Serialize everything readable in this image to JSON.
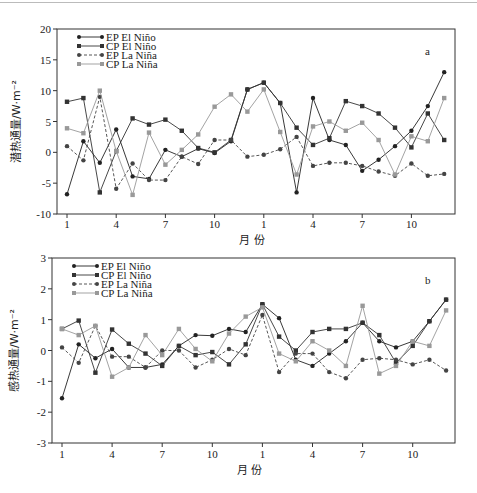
{
  "chart_data": [
    {
      "type": "line",
      "panel_label": "a",
      "xlabel": "月 份",
      "ylabel": "潜热通量/W·m⁻²",
      "ylim": [
        -10,
        20
      ],
      "yticks": [
        -10,
        -5,
        0,
        5,
        10,
        15,
        20
      ],
      "x_tick_labels": [
        "1",
        "4",
        "7",
        "10",
        "1",
        "4",
        "7",
        "10"
      ],
      "x_tick_index": [
        0,
        3,
        6,
        9,
        12,
        15,
        18,
        21
      ],
      "legend_position": "upper-left",
      "grid": false,
      "series": [
        {
          "name": "EP El Niño",
          "color": "#222222",
          "marker": "circle",
          "dash": "",
          "values": [
            -6.8,
            1.8,
            -1.7,
            3.7,
            -3.9,
            -4.3,
            0.4,
            -0.7,
            0.6,
            -0.1,
            1.8,
            10.2,
            11.3,
            8.0,
            -6.5,
            8.8,
            2.0,
            1.2,
            -3.0,
            -1.2,
            1.0,
            3.5,
            7.5,
            13.0
          ]
        },
        {
          "name": "CP El Niño",
          "color": "#333333",
          "marker": "square",
          "dash": "",
          "values": [
            8.2,
            8.8,
            -6.5,
            0.2,
            5.5,
            4.5,
            5.3,
            3.5,
            0.7,
            0.0,
            2.0,
            10.2,
            11.3,
            8.0,
            4.0,
            1.2,
            2.3,
            8.3,
            7.5,
            6.3,
            4.0,
            0.8,
            6.3,
            2.0
          ]
        },
        {
          "name": "EP La Niña",
          "color": "#444444",
          "marker": "circle",
          "dash": "3,2",
          "values": [
            1.0,
            -1.3,
            9.0,
            -5.9,
            -1.8,
            -4.5,
            -4.5,
            -0.7,
            -1.9,
            2.0,
            2.0,
            -0.7,
            -0.4,
            0.5,
            2.5,
            -2.2,
            -1.7,
            -1.7,
            -2.2,
            -3.1,
            -3.8,
            -1.8,
            -3.8,
            -3.5
          ]
        },
        {
          "name": "CP La Niña",
          "color": "#999999",
          "marker": "square",
          "dash": "",
          "values": [
            3.9,
            3.1,
            10.0,
            0.2,
            -6.9,
            3.2,
            -2.0,
            0.4,
            2.9,
            7.4,
            9.4,
            6.6,
            10.2,
            3.3,
            -3.6,
            4.2,
            5.0,
            3.5,
            4.8,
            2.0,
            -3.6,
            2.6,
            1.8,
            8.8
          ]
        }
      ]
    },
    {
      "type": "line",
      "panel_label": "b",
      "xlabel": "月 份",
      "ylabel": "感热通量/W·m⁻²",
      "ylim": [
        -3,
        3
      ],
      "yticks": [
        -3,
        -2,
        -1,
        0,
        1,
        2,
        3
      ],
      "x_tick_labels": [
        "1",
        "4",
        "7",
        "10",
        "1",
        "4",
        "7",
        "10"
      ],
      "x_tick_index": [
        0,
        3,
        6,
        9,
        12,
        15,
        18,
        21
      ],
      "legend_position": "upper-left",
      "grid": false,
      "series": [
        {
          "name": "EP El Niño",
          "color": "#222222",
          "marker": "circle",
          "dash": "",
          "values": [
            -1.55,
            0.2,
            -0.25,
            0.05,
            -0.55,
            -0.55,
            -0.45,
            0.15,
            0.5,
            0.48,
            0.7,
            0.6,
            1.5,
            1.05,
            -0.3,
            -0.5,
            -0.1,
            0.3,
            0.9,
            0.3,
            0.1,
            0.3,
            0.95,
            1.65
          ]
        },
        {
          "name": "CP El Niño",
          "color": "#333333",
          "marker": "square",
          "dash": "",
          "values": [
            0.7,
            0.97,
            -0.72,
            0.68,
            0.22,
            -0.1,
            -0.5,
            0.15,
            -0.15,
            -0.05,
            -0.45,
            0.2,
            1.5,
            0.45,
            0.0,
            0.6,
            0.7,
            0.7,
            0.9,
            0.5,
            -0.4,
            0.15,
            0.95,
            1.65
          ]
        },
        {
          "name": "EP La Niña",
          "color": "#444444",
          "marker": "circle",
          "dash": "3,2",
          "values": [
            0.1,
            -0.4,
            0.8,
            -0.2,
            -0.2,
            -0.55,
            0.0,
            0.0,
            -0.55,
            -0.3,
            0.05,
            -0.15,
            1.15,
            -0.7,
            -0.1,
            -0.1,
            -0.7,
            -0.9,
            -0.3,
            -0.25,
            -0.3,
            -0.45,
            -0.3,
            -0.65
          ]
        },
        {
          "name": "CP La Niña",
          "color": "#999999",
          "marker": "square",
          "dash": "",
          "values": [
            0.7,
            0.5,
            0.8,
            -0.85,
            -0.55,
            0.5,
            -0.15,
            0.7,
            0.05,
            -0.35,
            0.55,
            1.1,
            1.4,
            -0.1,
            -0.35,
            0.3,
            0.0,
            -0.5,
            1.45,
            -0.75,
            -0.5,
            0.3,
            0.15,
            1.3
          ]
        }
      ]
    }
  ]
}
